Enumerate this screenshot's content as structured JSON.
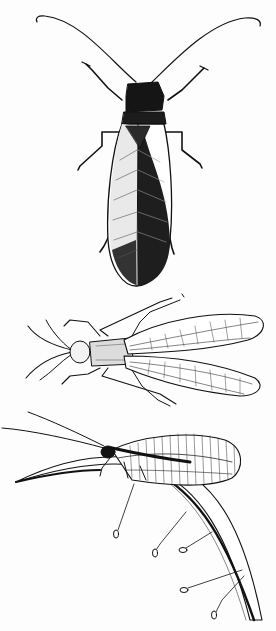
{
  "image": {
    "type": "natural-history line illustration",
    "background": "#fdfdfd",
    "ink": "#111111",
    "figures": [
      {
        "id": "fig-top",
        "subject": "winged insect, dorsal view, long antennae",
        "region": [
          35,
          15,
          265,
          285
        ]
      },
      {
        "id": "fig-middle",
        "subject": "insect with net-veined wings, dorsal view",
        "region": [
          20,
          295,
          265,
          410
        ]
      },
      {
        "id": "fig-bottom",
        "subject": "lacewing on curved leaf blade with stalked eggs",
        "region": [
          0,
          410,
          270,
          631
        ]
      }
    ]
  }
}
